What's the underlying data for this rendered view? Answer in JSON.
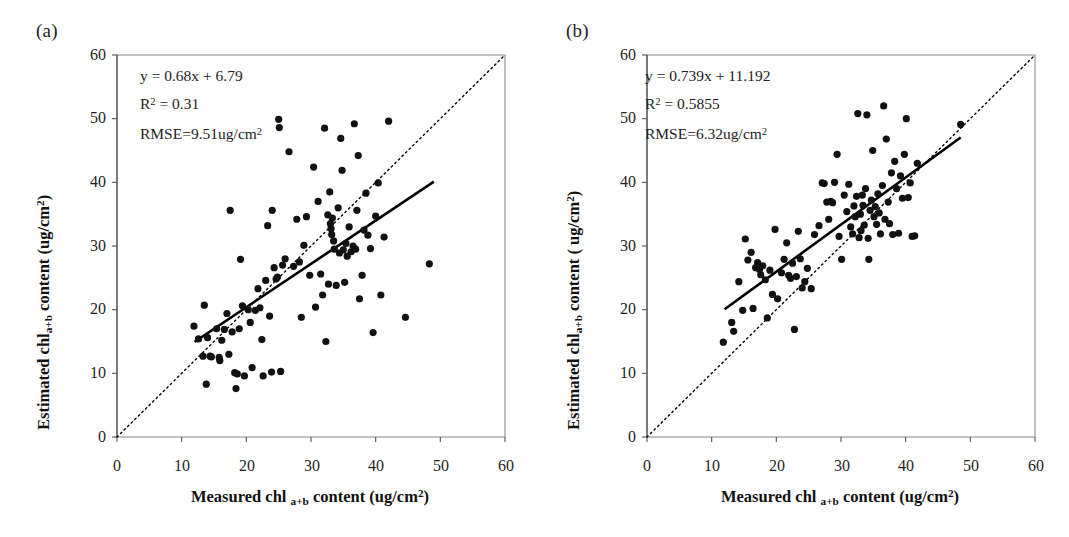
{
  "figure": {
    "background": "#ffffff",
    "point_color": "#111111",
    "line_color": "#000000",
    "frame_color": "#8f8f8f"
  },
  "panels": [
    {
      "id": "a",
      "label": "(a)",
      "annotations": {
        "equation": "y = 0.68x + 6.79",
        "r2_prefix": "R",
        "r2_sup": "2",
        "r2_value": " = 0.31",
        "rmse_prefix": "RMSE=9.51ug/cm",
        "rmse_sup": "2"
      },
      "axes": {
        "xlabel_part1": "Measured chl ",
        "xlabel_sub": "a+b",
        "xlabel_part2": " content (ug/cm",
        "xlabel_sup": "2",
        "xlabel_part3": ")",
        "ylabel_part1": "Estimated chl",
        "ylabel_sub": "a+b",
        "ylabel_part2": " content (ug/cm",
        "ylabel_sup": "2",
        "ylabel_part3": ")"
      }
    },
    {
      "id": "b",
      "label": "(b)",
      "annotations": {
        "equation": "y = 0.739x + 11.192",
        "r2_prefix": "R",
        "r2_sup": "2",
        "r2_value": " = 0.5855",
        "rmse_prefix": "RMSE=6.32ug/cm",
        "rmse_sup": "2"
      },
      "axes": {
        "xlabel_part1": "Measured chl ",
        "xlabel_sub": "a+b",
        "xlabel_part2": " content (ug/cm",
        "xlabel_sup": "2",
        "xlabel_part3": ")",
        "ylabel_part1": "Estimated chl",
        "ylabel_sub": "a+b",
        "ylabel_part2": " content ( ug/cm",
        "ylabel_sup": "2",
        "ylabel_part3": ")"
      }
    }
  ],
  "chart_data": [
    {
      "type": "scatter",
      "panel": "a",
      "title": "(a)",
      "xlabel": "Measured chl a+b content (ug/cm2)",
      "ylabel": "Estimated chl a+b content (ug/cm2)",
      "xlim": [
        0,
        60
      ],
      "ylim": [
        0,
        60
      ],
      "xticks": [
        0,
        10,
        20,
        30,
        40,
        50,
        60
      ],
      "yticks": [
        0,
        10,
        20,
        30,
        40,
        50,
        60
      ],
      "grid": false,
      "legend": "none",
      "annotations": {
        "equation": "y = 0.68x + 6.79",
        "r_squared": 0.31,
        "rmse": 9.51,
        "rmse_units": "ug/cm2"
      },
      "fit_line": {
        "slope": 0.68,
        "intercept": 6.79,
        "x_start": 12.0,
        "x_end": 49.0,
        "style": "solid"
      },
      "one_to_one_line": {
        "style": "dotted",
        "x_start": 0,
        "x_end": 60
      },
      "points": [
        [
          11.9,
          17.4
        ],
        [
          12.6,
          15.4
        ],
        [
          13.3,
          12.7
        ],
        [
          13.5,
          20.7
        ],
        [
          13.8,
          8.3
        ],
        [
          14.0,
          15.6
        ],
        [
          14.4,
          12.7
        ],
        [
          14.6,
          12.6
        ],
        [
          15.4,
          17.0
        ],
        [
          15.8,
          12.5
        ],
        [
          15.9,
          12.0
        ],
        [
          16.2,
          15.2
        ],
        [
          16.6,
          16.9
        ],
        [
          17.0,
          19.4
        ],
        [
          17.3,
          13.0
        ],
        [
          17.5,
          35.6
        ],
        [
          17.8,
          16.5
        ],
        [
          18.2,
          10.1
        ],
        [
          18.4,
          7.6
        ],
        [
          18.6,
          9.9
        ],
        [
          18.9,
          17.0
        ],
        [
          19.1,
          27.9
        ],
        [
          19.4,
          20.6
        ],
        [
          19.7,
          9.6
        ],
        [
          20.3,
          20.0
        ],
        [
          20.6,
          18.0
        ],
        [
          20.9,
          10.9
        ],
        [
          21.4,
          19.9
        ],
        [
          21.8,
          23.3
        ],
        [
          22.1,
          20.3
        ],
        [
          22.4,
          15.3
        ],
        [
          22.6,
          9.6
        ],
        [
          23.0,
          24.6
        ],
        [
          23.3,
          33.2
        ],
        [
          23.6,
          19.0
        ],
        [
          23.9,
          10.2
        ],
        [
          24.0,
          35.6
        ],
        [
          24.3,
          26.6
        ],
        [
          24.6,
          24.8
        ],
        [
          24.8,
          25.1
        ],
        [
          25.0,
          49.9
        ],
        [
          25.1,
          48.6
        ],
        [
          25.3,
          10.3
        ],
        [
          25.6,
          27.0
        ],
        [
          26.0,
          28.0
        ],
        [
          26.6,
          44.8
        ],
        [
          27.3,
          26.8
        ],
        [
          27.8,
          34.2
        ],
        [
          28.2,
          27.5
        ],
        [
          28.5,
          18.8
        ],
        [
          28.9,
          30.1
        ],
        [
          29.3,
          34.6
        ],
        [
          29.8,
          25.4
        ],
        [
          30.4,
          42.4
        ],
        [
          30.7,
          20.4
        ],
        [
          31.1,
          37.0
        ],
        [
          31.5,
          25.6
        ],
        [
          31.8,
          22.3
        ],
        [
          32.1,
          48.5
        ],
        [
          32.3,
          15.0
        ],
        [
          32.6,
          34.9
        ],
        [
          32.7,
          24.0
        ],
        [
          32.9,
          38.5
        ],
        [
          33.0,
          33.5
        ],
        [
          33.1,
          32.7
        ],
        [
          33.2,
          31.8
        ],
        [
          33.3,
          34.4
        ],
        [
          33.5,
          30.8
        ],
        [
          33.6,
          29.5
        ],
        [
          33.9,
          23.8
        ],
        [
          34.2,
          36.0
        ],
        [
          34.4,
          28.9
        ],
        [
          34.6,
          46.9
        ],
        [
          34.8,
          41.9
        ],
        [
          35.0,
          29.4
        ],
        [
          35.2,
          24.3
        ],
        [
          35.4,
          30.4
        ],
        [
          35.6,
          28.4
        ],
        [
          35.9,
          33.0
        ],
        [
          36.2,
          29.1
        ],
        [
          36.5,
          30.0
        ],
        [
          36.7,
          49.2
        ],
        [
          36.9,
          29.5
        ],
        [
          37.1,
          35.6
        ],
        [
          37.3,
          44.2
        ],
        [
          37.5,
          21.7
        ],
        [
          37.9,
          25.4
        ],
        [
          38.2,
          32.5
        ],
        [
          38.5,
          38.3
        ],
        [
          38.8,
          31.7
        ],
        [
          39.2,
          29.6
        ],
        [
          39.6,
          16.4
        ],
        [
          40.0,
          34.7
        ],
        [
          40.4,
          39.9
        ],
        [
          40.8,
          22.3
        ],
        [
          41.3,
          31.4
        ],
        [
          42.0,
          49.6
        ],
        [
          44.6,
          18.8
        ],
        [
          48.3,
          27.2
        ]
      ]
    },
    {
      "type": "scatter",
      "panel": "b",
      "title": "(b)",
      "xlabel": "Measured chl a+b content (ug/cm2)",
      "ylabel": "Estimated chl a+b content (ug/cm2)",
      "xlim": [
        0,
        60
      ],
      "ylim": [
        0,
        60
      ],
      "xticks": [
        0,
        10,
        20,
        30,
        40,
        50,
        60
      ],
      "yticks": [
        0,
        10,
        20,
        30,
        40,
        50,
        60
      ],
      "grid": false,
      "legend": "none",
      "annotations": {
        "equation": "y = 0.739x + 11.192",
        "r_squared": 0.5855,
        "rmse": 6.32,
        "rmse_units": "ug/cm2"
      },
      "fit_line": {
        "slope": 0.739,
        "intercept": 11.192,
        "x_start": 12.0,
        "x_end": 48.5,
        "style": "solid"
      },
      "one_to_one_line": {
        "style": "dotted",
        "x_start": 0,
        "x_end": 60
      },
      "points": [
        [
          11.8,
          14.9
        ],
        [
          13.1,
          18.0
        ],
        [
          13.4,
          16.6
        ],
        [
          14.2,
          24.4
        ],
        [
          14.8,
          19.9
        ],
        [
          15.2,
          31.1
        ],
        [
          15.6,
          27.8
        ],
        [
          16.1,
          29.0
        ],
        [
          16.4,
          20.2
        ],
        [
          16.8,
          26.6
        ],
        [
          17.1,
          27.4
        ],
        [
          17.4,
          26.3
        ],
        [
          17.6,
          25.5
        ],
        [
          17.9,
          26.9
        ],
        [
          18.3,
          24.7
        ],
        [
          18.6,
          18.7
        ],
        [
          19.0,
          26.2
        ],
        [
          19.4,
          22.4
        ],
        [
          19.8,
          32.6
        ],
        [
          20.2,
          21.7
        ],
        [
          20.8,
          25.8
        ],
        [
          21.2,
          27.9
        ],
        [
          21.6,
          30.5
        ],
        [
          21.9,
          25.4
        ],
        [
          22.2,
          24.9
        ],
        [
          22.5,
          27.3
        ],
        [
          22.8,
          16.9
        ],
        [
          23.1,
          25.2
        ],
        [
          23.4,
          32.3
        ],
        [
          23.7,
          28.0
        ],
        [
          24.0,
          23.4
        ],
        [
          24.4,
          24.4
        ],
        [
          24.8,
          26.5
        ],
        [
          25.4,
          23.3
        ],
        [
          25.9,
          31.8
        ],
        [
          26.6,
          33.2
        ],
        [
          27.1,
          39.9
        ],
        [
          27.4,
          39.8
        ],
        [
          27.8,
          36.9
        ],
        [
          28.1,
          34.2
        ],
        [
          28.4,
          37.0
        ],
        [
          28.7,
          36.8
        ],
        [
          29.0,
          40.0
        ],
        [
          29.4,
          44.4
        ],
        [
          29.7,
          31.5
        ],
        [
          30.1,
          27.9
        ],
        [
          30.5,
          38.0
        ],
        [
          30.9,
          35.4
        ],
        [
          31.2,
          39.7
        ],
        [
          31.5,
          33.0
        ],
        [
          31.8,
          31.9
        ],
        [
          32.0,
          36.3
        ],
        [
          32.2,
          34.6
        ],
        [
          32.4,
          37.8
        ],
        [
          32.6,
          50.8
        ],
        [
          32.8,
          31.3
        ],
        [
          33.0,
          35.0
        ],
        [
          33.1,
          32.4
        ],
        [
          33.3,
          38.0
        ],
        [
          33.4,
          36.4
        ],
        [
          33.6,
          33.3
        ],
        [
          33.8,
          39.0
        ],
        [
          34.0,
          50.6
        ],
        [
          34.2,
          31.2
        ],
        [
          34.3,
          27.9
        ],
        [
          34.5,
          35.6
        ],
        [
          34.7,
          37.2
        ],
        [
          34.9,
          45.0
        ],
        [
          35.1,
          34.6
        ],
        [
          35.3,
          36.2
        ],
        [
          35.5,
          33.4
        ],
        [
          35.7,
          38.2
        ],
        [
          35.9,
          35.2
        ],
        [
          36.1,
          31.9
        ],
        [
          36.4,
          39.5
        ],
        [
          36.6,
          52.0
        ],
        [
          36.8,
          34.2
        ],
        [
          37.0,
          46.8
        ],
        [
          37.3,
          36.9
        ],
        [
          37.5,
          33.5
        ],
        [
          37.8,
          41.5
        ],
        [
          38.0,
          31.8
        ],
        [
          38.3,
          43.3
        ],
        [
          38.6,
          39.0
        ],
        [
          38.9,
          32.0
        ],
        [
          39.2,
          41.0
        ],
        [
          39.5,
          37.5
        ],
        [
          39.8,
          44.4
        ],
        [
          40.1,
          50.0
        ],
        [
          40.4,
          37.6
        ],
        [
          40.7,
          39.9
        ],
        [
          41.0,
          31.5
        ],
        [
          41.4,
          31.6
        ],
        [
          41.8,
          43.0
        ],
        [
          48.5,
          49.1
        ]
      ]
    }
  ]
}
